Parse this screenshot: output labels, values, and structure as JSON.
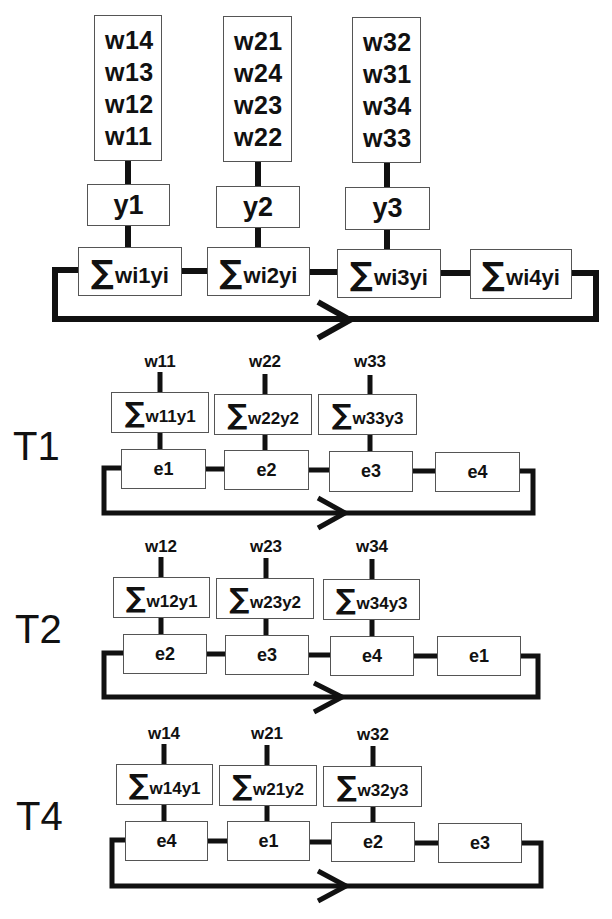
{
  "top": {
    "weight_columns": [
      [
        "w14",
        "w13",
        "w12",
        "w11"
      ],
      [
        "w21",
        "w24",
        "w23",
        "w22"
      ],
      [
        "w32",
        "w31",
        "w34",
        "w33"
      ]
    ],
    "outputs": [
      "y1",
      "y2",
      "y3"
    ],
    "sums": [
      {
        "sigma": "∑",
        "expr": "wi1yi"
      },
      {
        "sigma": "∑",
        "expr": "wi2yi"
      },
      {
        "sigma": "∑",
        "expr": "wi3yi"
      },
      {
        "sigma": "∑",
        "expr": "wi4yi"
      }
    ]
  },
  "steps": [
    {
      "label": "T1",
      "weights": [
        "w11",
        "w22",
        "w33"
      ],
      "sums": [
        {
          "sigma": "∑",
          "expr": "w11y1"
        },
        {
          "sigma": "∑",
          "expr": "w22y2"
        },
        {
          "sigma": "∑",
          "expr": "w33y3"
        }
      ],
      "elements": [
        "e1",
        "e2",
        "e3",
        "e4"
      ]
    },
    {
      "label": "T2",
      "weights": [
        "w12",
        "w23",
        "w34"
      ],
      "sums": [
        {
          "sigma": "∑",
          "expr": "w12y1"
        },
        {
          "sigma": "∑",
          "expr": "w23y2"
        },
        {
          "sigma": "∑",
          "expr": "w34y3"
        }
      ],
      "elements": [
        "e2",
        "e3",
        "e4",
        "e1"
      ]
    },
    {
      "label": "T4",
      "weights": [
        "w14",
        "w21",
        "w32"
      ],
      "sums": [
        {
          "sigma": "∑",
          "expr": "w14y1"
        },
        {
          "sigma": "∑",
          "expr": "w21y2"
        },
        {
          "sigma": "∑",
          "expr": "w32y3"
        }
      ],
      "elements": [
        "e4",
        "e1",
        "e2",
        "e3"
      ]
    }
  ],
  "colors": {
    "line": "#111111",
    "box_border": "#555555",
    "background": "#ffffff"
  }
}
